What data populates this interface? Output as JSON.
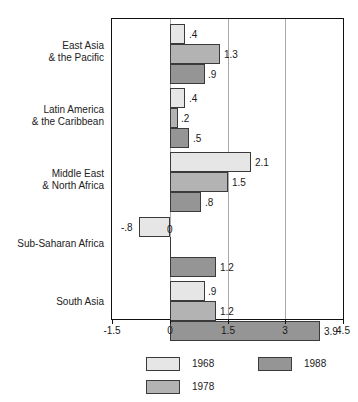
{
  "chart_data": {
    "type": "bar",
    "orientation": "horizontal",
    "title": "",
    "subtitle": "",
    "xlabel": "",
    "ylabel": "",
    "xlim": [
      -1.5,
      4.5
    ],
    "xticks": [
      "-1.5",
      "0",
      "1.5",
      "3",
      "4.5"
    ],
    "xtick_values": [
      -1.5,
      0,
      1.5,
      3,
      4.5
    ],
    "grid": true,
    "grid_axis": "x",
    "legend_position": "bottom",
    "categories": [
      "East Asia & the Pacific",
      "Latin America & the Caribbean",
      "Middle East & North Africa",
      "Sub-Saharan Africa",
      "South Asia"
    ],
    "series": [
      {
        "name": "1968",
        "color": "#e6e6e6",
        "values": [
          0.4,
          0.4,
          2.1,
          -0.8,
          0.9
        ]
      },
      {
        "name": "1978",
        "color": "#b3b3b3",
        "values": [
          1.3,
          0.2,
          1.5,
          0.0,
          1.2
        ]
      },
      {
        "name": "1988",
        "color": "#959595",
        "values": [
          0.9,
          0.5,
          0.8,
          1.2,
          3.9
        ]
      }
    ],
    "data_labels": [
      [
        ".4",
        "1.3",
        ".9"
      ],
      [
        ".4",
        ".2",
        ".5"
      ],
      [
        "2.1",
        "1.5",
        ".8"
      ],
      [
        "-.8",
        "0",
        "1.2"
      ],
      [
        ".9",
        "1.2",
        "3.9"
      ]
    ]
  },
  "categories_display": [
    {
      "line1": "East Asia",
      "line2": "& the Pacific"
    },
    {
      "line1": "Latin America",
      "line2": "& the Caribbean"
    },
    {
      "line1": "Middle East",
      "line2": "& North Africa"
    },
    {
      "line1": "Sub-Saharan Africa",
      "line2": ""
    },
    {
      "line1": "South Asia",
      "line2": ""
    }
  ],
  "axis": {
    "ticks": [
      {
        "label": "-1.5",
        "value": -1.5
      },
      {
        "label": "0",
        "value": 0
      },
      {
        "label": "1.5",
        "value": 1.5
      },
      {
        "label": "3",
        "value": 3
      },
      {
        "label": "4.5",
        "value": 4.5
      }
    ]
  },
  "legend": {
    "items": [
      {
        "label": "1968",
        "color": "#e6e6e6"
      },
      {
        "label": "1978",
        "color": "#b3b3b3"
      },
      {
        "label": "1988",
        "color": "#959595"
      }
    ]
  }
}
